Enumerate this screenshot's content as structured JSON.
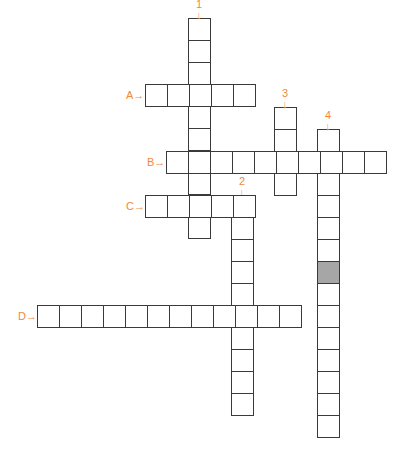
{
  "puzzle": {
    "cell_size": 22,
    "colors": {
      "label": "#f08a3a",
      "border": "#3a3a3a",
      "shaded": "#a6a6a6"
    },
    "down": [
      {
        "label": "1",
        "x": 188,
        "y": 18,
        "length": 10
      },
      {
        "label": "2",
        "x": 231,
        "y": 195,
        "length": 10
      },
      {
        "label": "3",
        "x": 274,
        "y": 107,
        "length": 4
      },
      {
        "label": "4",
        "x": 317,
        "y": 129,
        "length": 14,
        "shaded_index": 6
      }
    ],
    "across": [
      {
        "label": "A",
        "x": 145,
        "y": 84,
        "length": 5
      },
      {
        "label": "B",
        "x": 166,
        "y": 151,
        "length": 10
      },
      {
        "label": "C",
        "x": 145,
        "y": 195,
        "length": 5
      },
      {
        "label": "D",
        "x": 37,
        "y": 305,
        "length": 12
      }
    ],
    "down_arrow": "↓",
    "across_arrow": "→"
  }
}
